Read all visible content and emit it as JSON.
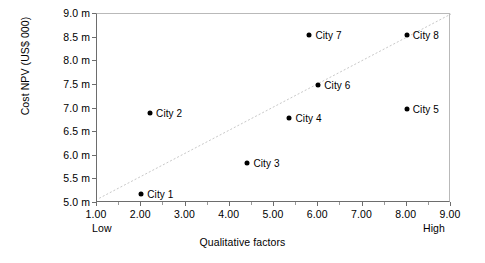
{
  "chart_data": {
    "type": "scatter",
    "title": "",
    "xlabel": "Qualitative factors",
    "ylabel": "Cost NPV (US$ 000)",
    "xlim": [
      1.0,
      9.0
    ],
    "ylim": [
      9.0,
      5.0
    ],
    "y_inverted": true,
    "grid": false,
    "legend": "none",
    "x_ticks": [
      "1.00",
      "2.00",
      "3.00",
      "4.00",
      "5.00",
      "6.00",
      "7.00",
      "8.00",
      "9.00"
    ],
    "x_tick_values": [
      1,
      2,
      3,
      4,
      5,
      6,
      7,
      8,
      9
    ],
    "y_ticks": [
      "5.0 m",
      "5.5 m",
      "6.0 m",
      "6.5 m",
      "7.0 m",
      "7.5 m",
      "8.0 m",
      "8.5 m",
      "9.0 m"
    ],
    "y_tick_values": [
      5.0,
      5.5,
      6.0,
      6.5,
      7.0,
      7.5,
      8.0,
      8.5,
      9.0
    ],
    "x_axis_low_label": "Low",
    "x_axis_high_label": "High",
    "points": [
      {
        "label": "City 1",
        "x": 2.0,
        "y": 5.2
      },
      {
        "label": "City 2",
        "x": 2.2,
        "y": 6.9
      },
      {
        "label": "City 3",
        "x": 4.4,
        "y": 5.85
      },
      {
        "label": "City 4",
        "x": 5.35,
        "y": 6.8
      },
      {
        "label": "City 5",
        "x": 8.0,
        "y": 7.0
      },
      {
        "label": "City 6",
        "x": 6.0,
        "y": 7.5
      },
      {
        "label": "City 7",
        "x": 5.8,
        "y": 8.55
      },
      {
        "label": "City 8",
        "x": 8.0,
        "y": 8.55
      }
    ],
    "trendline": {
      "style": "dotted",
      "color": "#c8c8c8",
      "x_start": 1.05,
      "y_start": 5.1,
      "x_end": 9.0,
      "y_end": 9.0
    }
  }
}
